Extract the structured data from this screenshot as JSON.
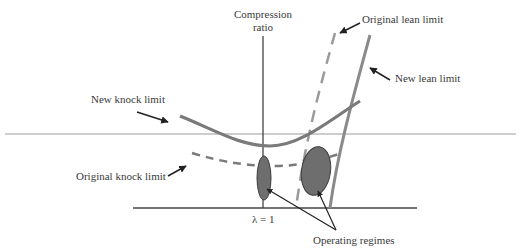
{
  "diagram": {
    "axis_label": "Compression\nratio",
    "axis_label_line1": "Compression",
    "axis_label_line2": "ratio",
    "x_marker": "λ = 1",
    "labels": {
      "original_lean_limit": "Original lean limit",
      "new_lean_limit": "New lean limit",
      "new_knock_limit": "New knock limit",
      "original_knock_limit": "Original knock limit",
      "operating_regimes": "Operating regimes"
    },
    "colors": {
      "curve": "#7a7a7a",
      "axis": "#444444",
      "regime_fill": "#6e6e6e",
      "regime_stroke": "#3c3c3c",
      "arrow": "#222222",
      "text": "#3a3a3a"
    }
  }
}
